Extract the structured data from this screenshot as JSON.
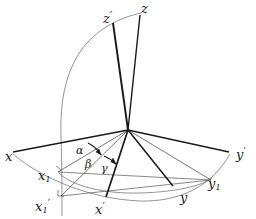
{
  "figure": {
    "background_color": "#ffffff",
    "line_color": "#1a1a1a",
    "thin_line_color": "#555555",
    "width": 256,
    "height": 219
  },
  "origin": {
    "x": 128,
    "y": 130
  },
  "axes": [
    {
      "id": "x",
      "label": "x",
      "prime": "",
      "sub": "",
      "label_x": 5,
      "label_y": 150,
      "end_x": 13,
      "end_y": 152,
      "weight": "thick"
    },
    {
      "id": "x1",
      "label": "x",
      "prime": "",
      "sub": "1",
      "label_x": 38,
      "label_y": 169,
      "end_x": 59,
      "end_y": 172,
      "weight": "thin"
    },
    {
      "id": "x1prime",
      "label": "x",
      "prime": "′",
      "sub": "1",
      "label_x": 35,
      "label_y": 198,
      "end_x": 62,
      "end_y": 196,
      "weight": "thin"
    },
    {
      "id": "xprime",
      "label": "x",
      "prime": "′",
      "sub": "",
      "label_x": 95,
      "label_y": 201,
      "end_x": 106,
      "end_y": 197,
      "weight": "thick"
    },
    {
      "id": "y",
      "label": "y",
      "prime": "",
      "sub": "",
      "label_x": 180,
      "label_y": 191,
      "end_x": 172,
      "end_y": 185,
      "weight": "thick"
    },
    {
      "id": "y1",
      "label": "y",
      "prime": "",
      "sub": "1",
      "label_x": 208,
      "label_y": 177,
      "end_x": 210,
      "end_y": 179,
      "weight": "thin"
    },
    {
      "id": "yprime",
      "label": "y",
      "prime": "′",
      "sub": "",
      "label_x": 236,
      "label_y": 146,
      "end_x": 229,
      "end_y": 152,
      "weight": "thick"
    },
    {
      "id": "z",
      "label": "z",
      "prime": "",
      "sub": "",
      "label_x": 141,
      "label_y": 2,
      "end_x": 140,
      "end_y": 15,
      "weight": "thick"
    },
    {
      "id": "zprime",
      "label": "z",
      "prime": "′",
      "sub": "",
      "label_x": 103,
      "label_y": 10,
      "end_x": 113,
      "end_y": 22,
      "weight": "thick"
    }
  ],
  "angles": [
    {
      "id": "alpha",
      "label": "α",
      "label_x": 76,
      "label_y": 145
    },
    {
      "id": "beta",
      "label": "β",
      "label_x": 85,
      "label_y": 159
    },
    {
      "id": "gamma",
      "label": "γ",
      "label_x": 101,
      "label_y": 163
    }
  ],
  "arcs": [
    {
      "id": "meridian-arc",
      "description": "great circle arc from z through x-prime plane",
      "weight": "thin"
    },
    {
      "id": "equator-arc-outer",
      "description": "outer horizontal ellipse arc from x to y-prime",
      "weight": "thin"
    },
    {
      "id": "equator-arc-inner",
      "description": "inner tilted ellipse arc from x1-prime to y1",
      "weight": "thin"
    }
  ]
}
